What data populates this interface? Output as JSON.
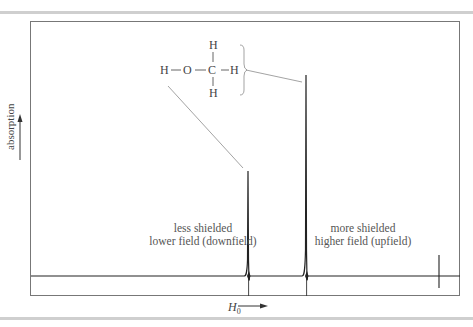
{
  "figure": {
    "y_axis_label": "absorption",
    "x_axis_label_main": "H",
    "x_axis_label_sub": "0",
    "molecule": {
      "name": "methanol",
      "atoms": {
        "h_top": "H",
        "h_left": "H",
        "o": "O",
        "c": "C",
        "h_right": "H",
        "h_bottom": "H"
      }
    },
    "annotations": {
      "oh_line1": "less shielded",
      "oh_line2": "lower field (downfield)",
      "ch3_line1": "more shielded",
      "ch3_line2": "higher field (upfield)"
    },
    "peaks": [
      {
        "id": "OH",
        "relative_position": "downfield",
        "relative_height": "smaller"
      },
      {
        "id": "CH3",
        "relative_position": "upfield",
        "relative_height": "larger"
      },
      {
        "id": "reference",
        "relative_position": "far upfield",
        "relative_height": "small spike"
      }
    ],
    "colors": {
      "trace": "#222222",
      "frame": "#777777",
      "leader": "#999999",
      "rule": "#cfcfcf"
    }
  }
}
